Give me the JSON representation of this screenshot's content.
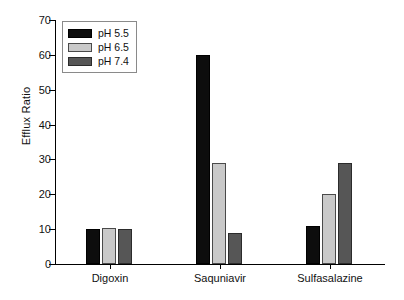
{
  "chart_data": {
    "type": "bar",
    "title": "",
    "xlabel": "",
    "ylabel": "Efflux Ratio",
    "ylim": [
      0,
      70
    ],
    "yticks": [
      0,
      10,
      20,
      30,
      40,
      50,
      60,
      70
    ],
    "grid": false,
    "legend_position": "top-left",
    "categories": [
      "Digoxin",
      "Saquniavir",
      "Sulfasalazine"
    ],
    "series": [
      {
        "name": "pH 5.5",
        "color": "#0d0d0d",
        "values": [
          10,
          60,
          11
        ]
      },
      {
        "name": "pH 6.5",
        "color": "#c9c9c9",
        "values": [
          10.3,
          29,
          20
        ]
      },
      {
        "name": "pH 7.4",
        "color": "#565656",
        "values": [
          10,
          9,
          29
        ]
      }
    ]
  }
}
